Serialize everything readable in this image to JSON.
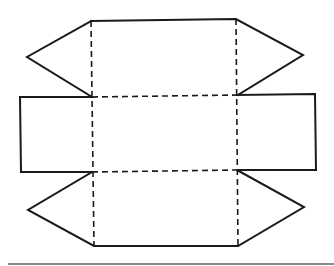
{
  "diagram": {
    "type": "triangular-prism-net",
    "colors": {
      "line": "#1a1a1a",
      "rule": "#8a8a8a",
      "background": "#ffffff"
    },
    "outline": [
      [
        91,
        21
      ],
      [
        236,
        19
      ],
      [
        303,
        55
      ],
      [
        238,
        95
      ],
      [
        315,
        94
      ],
      [
        316,
        170
      ],
      [
        237,
        170
      ],
      [
        304,
        207
      ],
      [
        238,
        246
      ],
      [
        94,
        246
      ],
      [
        28,
        210
      ],
      [
        92,
        172
      ],
      [
        21,
        172
      ],
      [
        20,
        97
      ],
      [
        92,
        97
      ],
      [
        27,
        57
      ],
      [
        91,
        21
      ]
    ],
    "fold_lines": [
      [
        [
          91,
          21
        ],
        [
          94,
          246
        ]
      ],
      [
        [
          236,
          19
        ],
        [
          238,
          246
        ]
      ],
      [
        [
          92,
          97
        ],
        [
          238,
          95
        ]
      ],
      [
        [
          92,
          172
        ],
        [
          237,
          170
        ]
      ]
    ],
    "rule": {
      "x1": 8,
      "y1": 264,
      "x2": 334,
      "y2": 264
    }
  }
}
